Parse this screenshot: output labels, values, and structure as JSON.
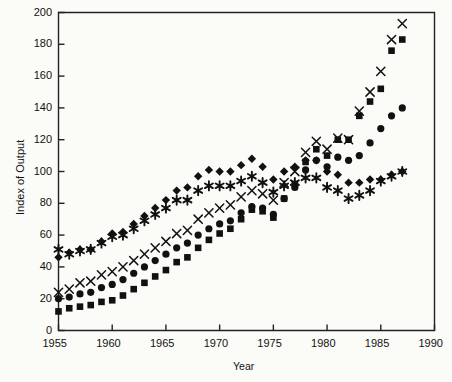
{
  "figure": {
    "background": "#fbfbf8",
    "ink": "#111111",
    "axis_color": "#222222"
  },
  "axes": {
    "x_title": "Year",
    "y_title": "Index of Output",
    "x_ticks": [
      "1955",
      "1960",
      "1965",
      "1970",
      "1975",
      "1980",
      "1985",
      "1990"
    ],
    "y_ticks": [
      "0",
      "20",
      "40",
      "60",
      "80",
      "100",
      "120",
      "140",
      "160",
      "180",
      "200"
    ]
  },
  "chart_data": {
    "type": "scatter",
    "title": "",
    "xlabel": "Year",
    "ylabel": "Index of Output",
    "xlim": [
      1955,
      1990
    ],
    "ylim": [
      0,
      200
    ],
    "xticks": [
      1955,
      1960,
      1965,
      1970,
      1975,
      1980,
      1985,
      1990
    ],
    "yticks": [
      0,
      20,
      40,
      60,
      80,
      100,
      120,
      140,
      160,
      180,
      200
    ],
    "grid": false,
    "legend": "none",
    "x": [
      1955,
      1956,
      1957,
      1958,
      1959,
      1960,
      1961,
      1962,
      1963,
      1964,
      1965,
      1966,
      1967,
      1968,
      1969,
      1970,
      1971,
      1972,
      1973,
      1974,
      1975,
      1976,
      1977,
      1978,
      1979,
      1980,
      1981,
      1982,
      1983,
      1984,
      1985,
      1986,
      1987
    ],
    "series": [
      {
        "name": "diamond",
        "marker": "diamond",
        "values": [
          46,
          49,
          51,
          51,
          56,
          61,
          62,
          67,
          72,
          77,
          82,
          88,
          90,
          97,
          101,
          100,
          100,
          104,
          108,
          103,
          95,
          100,
          103,
          107,
          107,
          100,
          98,
          93,
          93,
          95,
          95,
          98,
          100
        ]
      },
      {
        "name": "asterisk",
        "marker": "asterisk",
        "values": [
          51,
          48,
          50,
          51,
          55,
          59,
          60,
          64,
          69,
          73,
          77,
          82,
          82,
          88,
          91,
          91,
          91,
          94,
          97,
          93,
          87,
          91,
          93,
          96,
          96,
          90,
          88,
          83,
          85,
          88,
          94,
          97,
          100
        ]
      },
      {
        "name": "x-mark",
        "marker": "x",
        "values": [
          24,
          26,
          30,
          31,
          35,
          37,
          40,
          44,
          48,
          52,
          56,
          61,
          63,
          70,
          74,
          77,
          79,
          84,
          88,
          86,
          82,
          93,
          100,
          112,
          119,
          114,
          121,
          120,
          138,
          150,
          163,
          183,
          193
        ]
      },
      {
        "name": "circle",
        "marker": "circle",
        "values": [
          20,
          21,
          23,
          24,
          27,
          29,
          32,
          36,
          40,
          44,
          48,
          52,
          55,
          60,
          64,
          67,
          69,
          74,
          78,
          77,
          73,
          83,
          90,
          101,
          107,
          103,
          109,
          107,
          110,
          118,
          127,
          135,
          140
        ]
      },
      {
        "name": "square",
        "marker": "square",
        "values": [
          12,
          14,
          15,
          16,
          18,
          19,
          22,
          26,
          30,
          34,
          38,
          43,
          46,
          52,
          57,
          61,
          64,
          70,
          76,
          75,
          71,
          83,
          92,
          106,
          114,
          110,
          120,
          120,
          135,
          144,
          152,
          176,
          183
        ]
      }
    ]
  }
}
